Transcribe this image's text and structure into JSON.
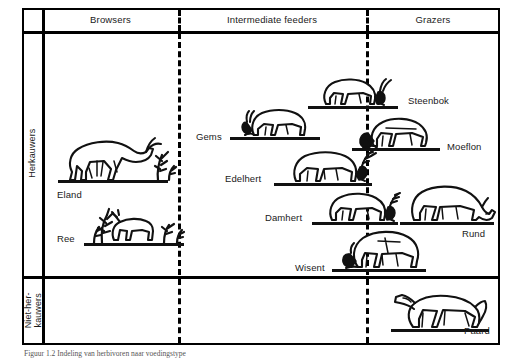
{
  "figure": {
    "type": "classification-diagram",
    "caption": "Figuur 1.2  Indeling van herbivoren naar voedingstype"
  },
  "columns": {
    "header": [
      {
        "id": "browsers",
        "label": "Browsers"
      },
      {
        "id": "intermediate",
        "label": "Intermediate feeders"
      },
      {
        "id": "grazers",
        "label": "Grazers"
      }
    ]
  },
  "rows": [
    {
      "id": "ruminants",
      "label": "Herkauwers"
    },
    {
      "id": "non-ruminants",
      "label": "Niet-her-\nkauwers"
    }
  ],
  "animals": [
    {
      "id": "eland",
      "label": "Eland",
      "row": "ruminants",
      "column": "browsers"
    },
    {
      "id": "ree",
      "label": "Ree",
      "row": "ruminants",
      "column": "browsers"
    },
    {
      "id": "gems",
      "label": "Gems",
      "row": "ruminants",
      "column": "intermediate"
    },
    {
      "id": "edelhert",
      "label": "Edelhert",
      "row": "ruminants",
      "column": "intermediate"
    },
    {
      "id": "damhert",
      "label": "Damhert",
      "row": "ruminants",
      "column": "intermediate"
    },
    {
      "id": "wisent",
      "label": "Wisent",
      "row": "ruminants",
      "column": "intermediate"
    },
    {
      "id": "steenbok",
      "label": "Steenbok",
      "row": "ruminants",
      "column": "grazers"
    },
    {
      "id": "moeflon",
      "label": "Moeflon",
      "row": "ruminants",
      "column": "grazers"
    },
    {
      "id": "rund",
      "label": "Rund",
      "row": "ruminants",
      "column": "grazers"
    },
    {
      "id": "paard",
      "label": "Paard",
      "row": "non-ruminants",
      "column": "grazers"
    }
  ],
  "colors": {
    "ink": "#111111",
    "background": "#ffffff",
    "rule": "#000000"
  }
}
